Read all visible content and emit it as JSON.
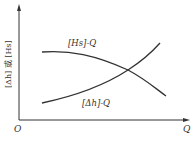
{
  "diagram": {
    "y_axis_label": "[Δh] 或 [Hs]",
    "x_axis_label": "Q",
    "origin_label": "O",
    "curves": [
      {
        "name": "Hs-Q",
        "label": "[Hs]-Q",
        "trend": "decreasing"
      },
      {
        "name": "dh-Q",
        "label": "[Δh]-Q",
        "trend": "increasing"
      }
    ],
    "colors": {
      "line": "#333333",
      "background": "#ffffff"
    }
  }
}
